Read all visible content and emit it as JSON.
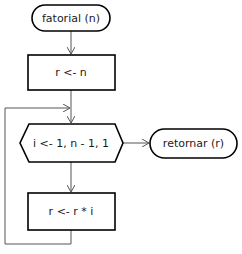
{
  "diagram": {
    "type": "flowchart",
    "nodes": [
      {
        "id": "start",
        "shape": "terminator",
        "label": "fatorial (n)"
      },
      {
        "id": "init",
        "shape": "process",
        "label": "r <- n"
      },
      {
        "id": "loop",
        "shape": "loop-hexagon",
        "label": "i <- 1, n - 1, 1"
      },
      {
        "id": "body",
        "shape": "process",
        "label": "r <- r * i"
      },
      {
        "id": "end",
        "shape": "terminator",
        "label": "retornar (r)"
      }
    ],
    "edges": [
      {
        "from": "start",
        "to": "init"
      },
      {
        "from": "init",
        "to": "loop"
      },
      {
        "from": "loop",
        "to": "body"
      },
      {
        "from": "body",
        "to": "loop",
        "kind": "loop-back"
      },
      {
        "from": "loop",
        "to": "end"
      }
    ],
    "colors": {
      "stroke": "#000000",
      "edge": "#555555",
      "background": "#ffffff"
    }
  }
}
